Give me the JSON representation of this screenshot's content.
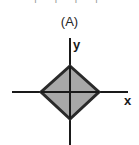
{
  "figure": {
    "panel_label": "(A)",
    "top_cropped_text": "|·|    |·|",
    "background_color": "#ffffff"
  },
  "axes": {
    "x_label": "x",
    "y_label": "y",
    "line_color": "#1a1a1a",
    "line_width": 2,
    "origin": {
      "x": 70,
      "y": 92
    },
    "x_axis": {
      "x1": 12,
      "y1": 92,
      "x2": 128,
      "y2": 92
    },
    "y_axis": {
      "x1": 70,
      "y1": 38,
      "x2": 70,
      "y2": 145
    }
  },
  "shape": {
    "name": "diamond",
    "description": "square rotated 45 degrees centered at origin",
    "fill_color": "#a8a8a8",
    "stroke_color": "#2a2a2a",
    "stroke_width": 3,
    "vertices": [
      {
        "x": 70,
        "y": 66
      },
      {
        "x": 99,
        "y": 92
      },
      {
        "x": 70,
        "y": 119
      },
      {
        "x": 41,
        "y": 92
      }
    ],
    "points_attr": "70,66 99,92 70,119 41,92"
  }
}
